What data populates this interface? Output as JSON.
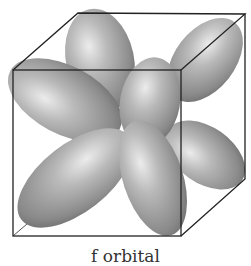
{
  "figure": {
    "caption": "f orbital",
    "lobe_color": "#a8a8a8",
    "lobe_highlight": "#e4e4e4",
    "lobe_shadow": "#6e6e6e",
    "edge_color": "#222222"
  }
}
